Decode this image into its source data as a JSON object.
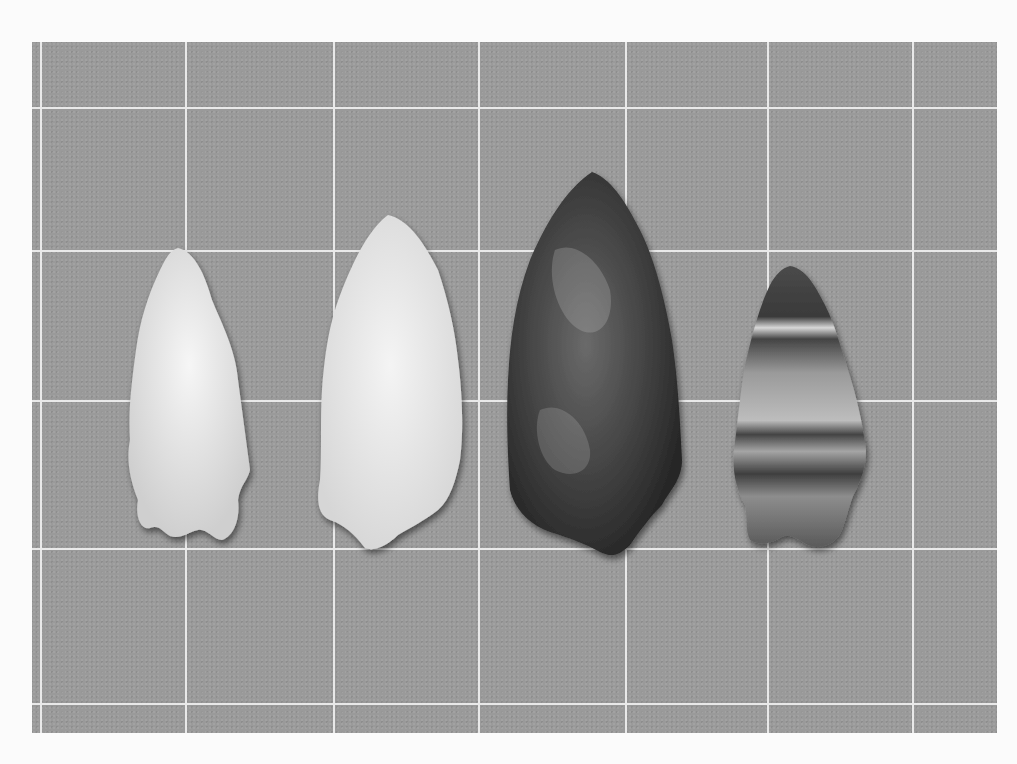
{
  "image": {
    "description": "Black-and-white photograph of four stone projectile points laid on a gridded background",
    "grid": {
      "vertical_lines_x": [
        40,
        185,
        333,
        478,
        625,
        767,
        912
      ],
      "horizontal_lines_y": [
        107,
        250,
        400,
        548,
        703
      ]
    },
    "points": [
      {
        "name": "point-1",
        "tone": "light",
        "color": "#e6e6e6"
      },
      {
        "name": "point-2",
        "tone": "light",
        "color": "#ececec"
      },
      {
        "name": "point-3",
        "tone": "dark",
        "color": "#3a3a3a"
      },
      {
        "name": "point-4",
        "tone": "banded",
        "color": "#7a7a7a"
      }
    ]
  }
}
